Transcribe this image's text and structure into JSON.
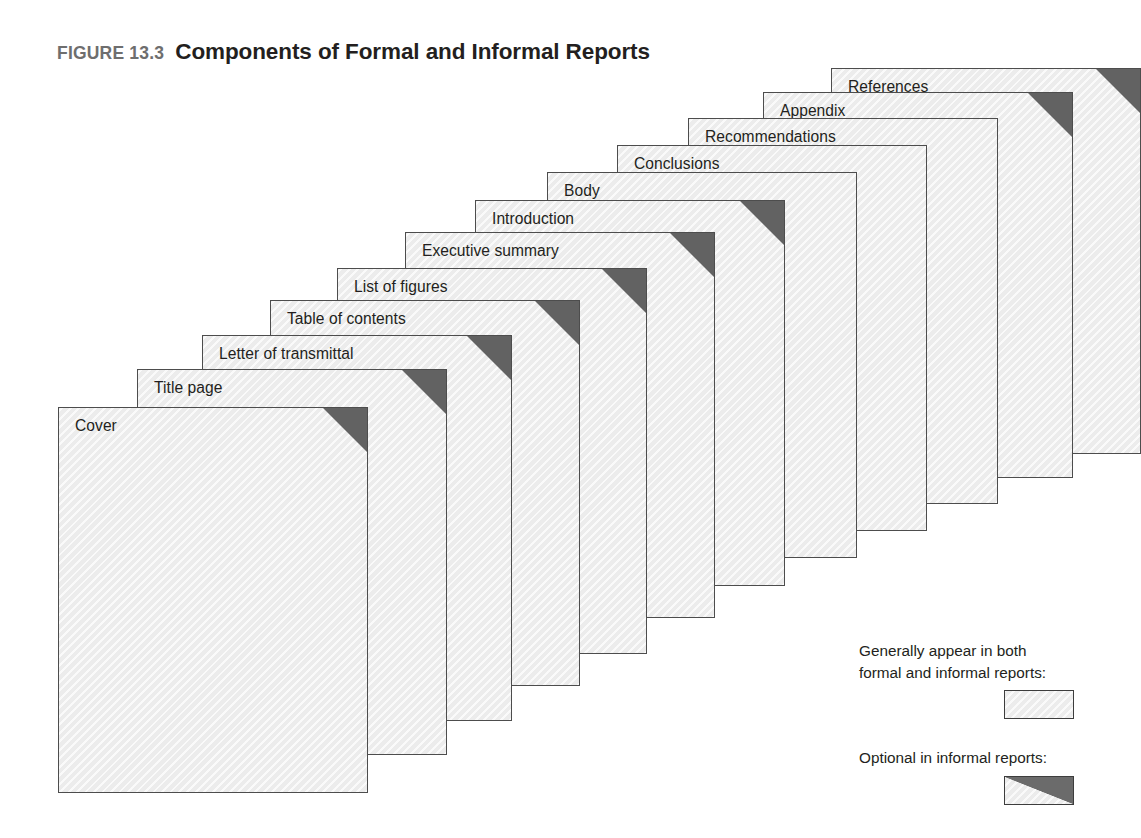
{
  "figure": {
    "number": "FIGURE 13.3",
    "title": "Components of Formal and Informal Reports"
  },
  "diagram_data": {
    "type": "diagram",
    "style": "stacked-offset-sheets",
    "description": "Twelve overlapping report pages fanned from lower-left to upper-right; each page is labeled with a report component. Pages marked with a dark folded corner are optional in informal reports.",
    "sheet_size": {
      "width": 310,
      "height": 386
    },
    "colors": {
      "sheet_fill": "#ececec",
      "sheet_border": "#4d4d4d",
      "optional_corner": "#626262",
      "label_text": "#231f20",
      "figure_number_text": "#6e6e6e",
      "background": "#ffffff"
    },
    "sheets": [
      {
        "label": "Cover",
        "left": 58,
        "top": 407,
        "optional": true
      },
      {
        "label": "Title page",
        "left": 137,
        "top": 369,
        "optional": true
      },
      {
        "label": "Letter of transmittal",
        "left": 202,
        "top": 335,
        "optional": true
      },
      {
        "label": "Table of contents",
        "left": 270,
        "top": 300,
        "optional": true
      },
      {
        "label": "List of figures",
        "left": 337,
        "top": 268,
        "optional": true
      },
      {
        "label": "Executive summary",
        "left": 405,
        "top": 232,
        "optional": true
      },
      {
        "label": "Introduction",
        "left": 475,
        "top": 200,
        "optional": true
      },
      {
        "label": "Body",
        "left": 547,
        "top": 172,
        "optional": false
      },
      {
        "label": "Conclusions",
        "left": 617,
        "top": 145,
        "optional": false
      },
      {
        "label": "Recommendations",
        "left": 688,
        "top": 118,
        "optional": false
      },
      {
        "label": "Appendix",
        "left": 763,
        "top": 92,
        "optional": true
      },
      {
        "label": "References",
        "left": 831,
        "top": 68,
        "optional": true
      }
    ]
  },
  "legend": {
    "entries": [
      {
        "text_line1": "Generally appear in both",
        "text_line2": "formal and informal reports:",
        "swatch": "plain"
      },
      {
        "text_line1": "Optional in informal reports:",
        "text_line2": "",
        "swatch": "split"
      }
    ]
  }
}
